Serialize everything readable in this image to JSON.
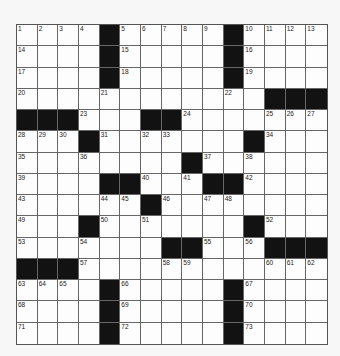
{
  "puzzle": {
    "rows": 15,
    "cols": 15,
    "colors": {
      "block": "#121212",
      "cell": "#fdfdfd",
      "line": "#666666"
    },
    "layout": [
      "....#.....#....",
      "....#.....#....",
      "....#.....#....",
      "...........#...",
      "###....##......",
      "...#.......#...",
      "........#......",
      "....##...##....",
      "......#........",
      "...#.......#...",
      "...........###.",
      "###............",
      "....#.....#....",
      "....#.....#....",
      "....#.....#...."
    ],
    "numbers": [
      [
        1,
        2,
        3,
        4,
        0,
        5,
        6,
        7,
        8,
        9,
        0,
        10,
        11,
        12,
        13
      ],
      [
        14,
        0,
        0,
        0,
        0,
        15,
        0,
        0,
        0,
        0,
        0,
        16,
        0,
        0,
        0
      ],
      [
        17,
        0,
        0,
        0,
        0,
        18,
        0,
        0,
        0,
        0,
        0,
        19,
        0,
        0,
        0
      ],
      [
        20,
        0,
        0,
        0,
        21,
        0,
        0,
        0,
        0,
        0,
        22,
        0,
        0,
        0,
        0
      ],
      [
        0,
        0,
        0,
        23,
        0,
        0,
        0,
        0,
        24,
        0,
        0,
        0,
        25,
        26,
        27
      ],
      [
        28,
        29,
        30,
        0,
        31,
        0,
        32,
        33,
        0,
        0,
        0,
        0,
        34,
        0,
        0
      ],
      [
        35,
        0,
        0,
        36,
        0,
        0,
        0,
        0,
        0,
        37,
        0,
        38,
        0,
        0,
        0
      ],
      [
        39,
        0,
        0,
        0,
        0,
        0,
        40,
        0,
        41,
        0,
        0,
        42,
        0,
        0,
        0
      ],
      [
        43,
        0,
        0,
        0,
        44,
        45,
        0,
        46,
        0,
        47,
        48,
        0,
        0,
        0,
        0
      ],
      [
        49,
        0,
        0,
        0,
        50,
        0,
        51,
        0,
        0,
        0,
        0,
        0,
        52,
        0,
        0
      ],
      [
        53,
        0,
        0,
        54,
        0,
        0,
        0,
        0,
        0,
        55,
        0,
        56,
        0,
        0,
        0
      ],
      [
        0,
        0,
        0,
        57,
        0,
        0,
        0,
        58,
        59,
        0,
        0,
        0,
        60,
        61,
        62
      ],
      [
        63,
        64,
        65,
        0,
        0,
        66,
        0,
        0,
        0,
        0,
        0,
        67,
        0,
        0,
        0
      ],
      [
        68,
        0,
        0,
        0,
        0,
        69,
        0,
        0,
        0,
        0,
        0,
        70,
        0,
        0,
        0
      ],
      [
        71,
        0,
        0,
        0,
        0,
        72,
        0,
        0,
        0,
        0,
        0,
        73,
        0,
        0,
        0
      ]
    ]
  }
}
